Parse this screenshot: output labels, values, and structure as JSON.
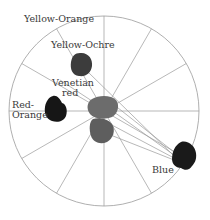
{
  "diagram": {
    "type": "color-wheel-palette",
    "wheel": {
      "center": [
        104,
        111
      ],
      "radius": 95,
      "segments": 12,
      "stroke": "#9a9a9a"
    },
    "labels": {
      "yellow_orange": "Yellow-Orange",
      "yellow_ochre": "Yellow-Ochre",
      "venetian_1": "Venetian",
      "venetian_2": "red",
      "red_orange_1": "Red-",
      "red_orange_2": "Orange",
      "blue": "Blue"
    },
    "swatches": [
      {
        "name": "yellow-ochre",
        "color": "#3c3c3c"
      },
      {
        "name": "red-orange",
        "color": "#161616"
      },
      {
        "name": "venetian-red-mix-upper",
        "color": "#6c6c6c"
      },
      {
        "name": "venetian-red-mix-lower",
        "color": "#5e5e5e"
      },
      {
        "name": "blue",
        "color": "#1a1a1a"
      }
    ],
    "colors": {
      "line": "#9a9a9a",
      "text": "#3a3a3a"
    }
  }
}
